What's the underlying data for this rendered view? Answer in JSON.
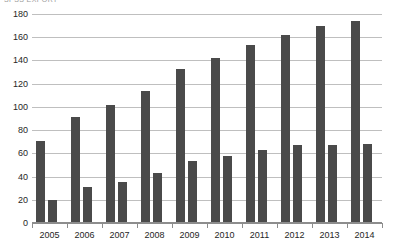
{
  "clipped_header_text": "SPSS  EXPORT",
  "colors": {
    "bar": "#4a4a4a",
    "gridline": "#bfbfbf",
    "axis": "#8d8d8d",
    "text": "#262626",
    "background": "#ffffff"
  },
  "chart_data": {
    "type": "bar",
    "title": "",
    "subtitle": "",
    "xlabel": "",
    "ylabel": "",
    "categories": [
      "2005",
      "2006",
      "2007",
      "2008",
      "2009",
      "2010",
      "2011",
      "2012",
      "2013",
      "2014"
    ],
    "series": [
      {
        "name": "Series 1",
        "values": [
          71,
          91,
          102,
          114,
          133,
          142,
          153,
          162,
          170,
          174
        ]
      },
      {
        "name": "Series 2",
        "values": [
          20,
          31,
          35,
          43,
          53,
          58,
          63,
          67,
          67,
          68
        ]
      }
    ],
    "ylim": [
      0,
      180
    ],
    "ytick_step": 20,
    "yticks": [
      0,
      20,
      40,
      60,
      80,
      100,
      120,
      140,
      160,
      180
    ],
    "ytick_labels": [
      "0",
      "20",
      "40",
      "60",
      "80",
      "100",
      "120",
      "140",
      "160",
      "180"
    ],
    "grid": true,
    "grid_axis": "y",
    "legend": false,
    "legend_position": "none"
  }
}
